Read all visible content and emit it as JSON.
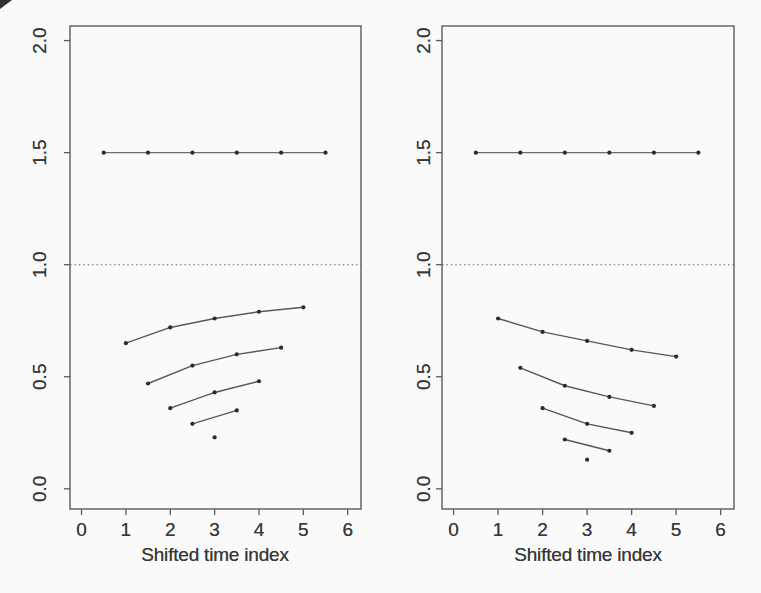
{
  "figure": {
    "background": "#fafafa",
    "text_color": "#383838",
    "line_color": "#585858",
    "flat_line_color": "#6d6d6d",
    "marker_color": "#2c2c2c",
    "box_color": "#5a5a5a",
    "reference_line_color": "#6e6e6e",
    "corner_artifact_color": "#1c1c1c"
  },
  "chart_data": [
    {
      "type": "line",
      "panel": "left",
      "title": "",
      "xlabel": "Shifted time index",
      "ylabel": "",
      "xlim": [
        -0.26,
        6.3
      ],
      "ylim": [
        -0.09,
        2.065
      ],
      "grid": false,
      "legend": null,
      "x_ticks": {
        "values": [
          0,
          1,
          2,
          3,
          4,
          5,
          6
        ],
        "labels": [
          "0",
          "1",
          "2",
          "3",
          "4",
          "5",
          "6"
        ]
      },
      "y_ticks": {
        "values": [
          0,
          0.5,
          1,
          1.5,
          2
        ],
        "labels": [
          "0.0",
          "0.5",
          "1.0",
          "1.5",
          "2.0"
        ]
      },
      "reference_line": {
        "y": 1.0,
        "style": "dotted"
      },
      "series": [
        {
          "name": "flat-line",
          "x": [
            0.5,
            1.5,
            2.5,
            3.5,
            4.5,
            5.5
          ],
          "y": [
            1.5,
            1.5,
            1.5,
            1.5,
            1.5,
            1.5
          ]
        },
        {
          "name": "curve-1",
          "x": [
            1,
            2,
            3,
            4,
            5
          ],
          "y": [
            0.65,
            0.72,
            0.76,
            0.79,
            0.81
          ]
        },
        {
          "name": "curve-2",
          "x": [
            1.5,
            2.5,
            3.5,
            4.5
          ],
          "y": [
            0.47,
            0.55,
            0.6,
            0.63
          ]
        },
        {
          "name": "curve-3",
          "x": [
            2,
            3,
            4
          ],
          "y": [
            0.36,
            0.43,
            0.48
          ]
        },
        {
          "name": "curve-4",
          "x": [
            2.5,
            3.5
          ],
          "y": [
            0.29,
            0.35
          ]
        },
        {
          "name": "single-point",
          "x": [
            3
          ],
          "y": [
            0.23
          ]
        }
      ]
    },
    {
      "type": "line",
      "panel": "right",
      "title": "",
      "xlabel": "Shifted time index",
      "ylabel": "",
      "xlim": [
        -0.26,
        6.3
      ],
      "ylim": [
        -0.09,
        2.065
      ],
      "grid": false,
      "legend": null,
      "x_ticks": {
        "values": [
          0,
          1,
          2,
          3,
          4,
          5,
          6
        ],
        "labels": [
          "0",
          "1",
          "2",
          "3",
          "4",
          "5",
          "6"
        ]
      },
      "y_ticks": {
        "values": [
          0,
          0.5,
          1,
          1.5,
          2
        ],
        "labels": [
          "0.0",
          "0.5",
          "1.0",
          "1.5",
          "2.0"
        ]
      },
      "reference_line": {
        "y": 1.0,
        "style": "dotted"
      },
      "series": [
        {
          "name": "flat-line",
          "x": [
            0.5,
            1.5,
            2.5,
            3.5,
            4.5,
            5.5
          ],
          "y": [
            1.5,
            1.5,
            1.5,
            1.5,
            1.5,
            1.5
          ]
        },
        {
          "name": "curve-1",
          "x": [
            1,
            2,
            3,
            4,
            5
          ],
          "y": [
            0.76,
            0.7,
            0.66,
            0.62,
            0.59
          ]
        },
        {
          "name": "curve-2",
          "x": [
            1.5,
            2.5,
            3.5,
            4.5
          ],
          "y": [
            0.54,
            0.46,
            0.41,
            0.37
          ]
        },
        {
          "name": "curve-3",
          "x": [
            2,
            3,
            4
          ],
          "y": [
            0.36,
            0.29,
            0.25
          ]
        },
        {
          "name": "curve-4",
          "x": [
            2.5,
            3.5
          ],
          "y": [
            0.22,
            0.17
          ]
        },
        {
          "name": "single-point",
          "x": [
            3
          ],
          "y": [
            0.13
          ]
        }
      ]
    }
  ]
}
